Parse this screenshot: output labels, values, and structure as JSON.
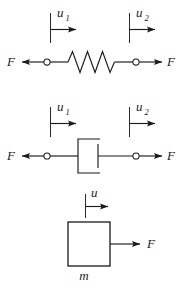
{
  "figure": {
    "background_color": "#ffffff",
    "ink_color": "#1a1a1a",
    "width": 183,
    "height": 292
  },
  "elements": [
    {
      "id": "spring",
      "name": "spring-element",
      "symbol": "zigzag-coil",
      "displacement_left": {
        "label": "u",
        "subscript": "1"
      },
      "displacement_right": {
        "label": "u",
        "subscript": "2"
      },
      "force_left": {
        "label": "F",
        "direction": "left"
      },
      "force_right": {
        "label": "F",
        "direction": "right"
      },
      "terminal_left": "open-circle-node",
      "terminal_right": "open-circle-node"
    },
    {
      "id": "damper",
      "name": "damper-element",
      "symbol": "dashpot-piston",
      "displacement_left": {
        "label": "u",
        "subscript": "1"
      },
      "displacement_right": {
        "label": "u",
        "subscript": "2"
      },
      "force_left": {
        "label": "F",
        "direction": "left"
      },
      "force_right": {
        "label": "F",
        "direction": "right"
      },
      "terminal_left": "open-circle-node",
      "terminal_right": "open-circle-node"
    },
    {
      "id": "mass",
      "name": "mass-element",
      "symbol": "rectangle-block",
      "displacement": {
        "label": "u",
        "subscript": ""
      },
      "force_right": {
        "label": "F",
        "direction": "right"
      },
      "mass_label": "m"
    }
  ],
  "labels": {
    "spring_u1": "u",
    "spring_u1_sub": "1",
    "spring_u2": "u",
    "spring_u2_sub": "2",
    "spring_F_left": "F",
    "spring_F_right": "F",
    "damper_u1": "u",
    "damper_u1_sub": "1",
    "damper_u2": "u",
    "damper_u2_sub": "2",
    "damper_F_left": "F",
    "damper_F_right": "F",
    "mass_u": "u",
    "mass_F": "F",
    "mass_m": "m"
  }
}
